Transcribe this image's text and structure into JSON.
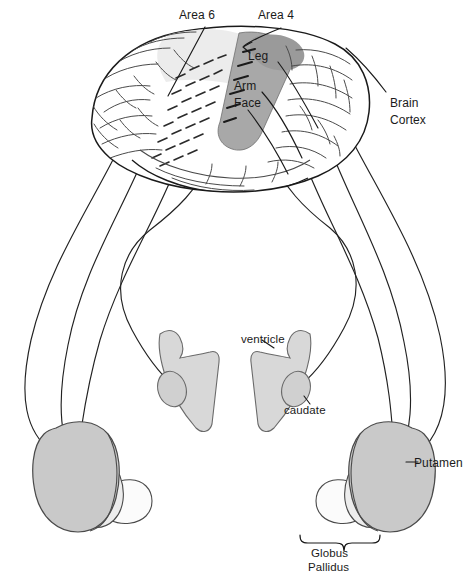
{
  "figure": {
    "background_color": "#ffffff",
    "width": 469,
    "height": 575
  },
  "labels": {
    "area6": "Area 6",
    "area4": "Area 4",
    "leg": "Leg",
    "arm": "Arm",
    "face": "Face",
    "brain_cortex_line1": "Brain",
    "brain_cortex_line2": "Cortex",
    "ventricle": "ventricle",
    "caudate": "caudate",
    "putamen": "Putamen",
    "globus_line1": "Globus",
    "globus_line2": "Pallidus"
  },
  "structures": [
    {
      "name": "brain-cortex",
      "label": "Brain Cortex",
      "fill": "#ffffff",
      "stroke": "#1a1a1a"
    },
    {
      "name": "premotor-area-6",
      "label": "Area 6",
      "fill": "#e8e8e8",
      "stroke": "#4a4a4a",
      "pattern": "dashed"
    },
    {
      "name": "primary-motor-area-4",
      "label": "Area 4",
      "fill": "#a8a8a8",
      "stroke": "#4a4a4a",
      "somatotopy": [
        "Leg",
        "Arm",
        "Face"
      ]
    },
    {
      "name": "lateral-ventricle",
      "label": "ventricle",
      "fill": "#d8d8d8",
      "stroke": "#6a6a6a"
    },
    {
      "name": "caudate-nucleus",
      "label": "caudate",
      "fill": "#d0d0d0",
      "stroke": "#6a6a6a"
    },
    {
      "name": "putamen",
      "label": "Putamen",
      "fill": "#c9c9c9",
      "stroke": "#4a4a4a"
    },
    {
      "name": "globus-pallidus-external",
      "label": "Globus Pallidus",
      "fill": "#ececec",
      "stroke": "#4a4a4a"
    },
    {
      "name": "globus-pallidus-internal",
      "label": "Globus Pallidus",
      "fill": "#fbfbfb",
      "stroke": "#4a4a4a"
    }
  ],
  "colors": {
    "ink": "#1a1a1a",
    "fiber": "#222222",
    "motor_strip": "#a8a8a8",
    "premotor": "#e8e8e8",
    "ventricle": "#d8d8d8",
    "putamen": "#c9c9c9",
    "pallidus_outer": "#ececec",
    "pallidus_inner": "#fbfbfb",
    "outline": "#4a4a4a"
  },
  "projection_fibers": {
    "count": 8,
    "description": "Long curving corticostriatal fibers descending from cortex to caudate and putamen, each ending in an arrowhead"
  }
}
